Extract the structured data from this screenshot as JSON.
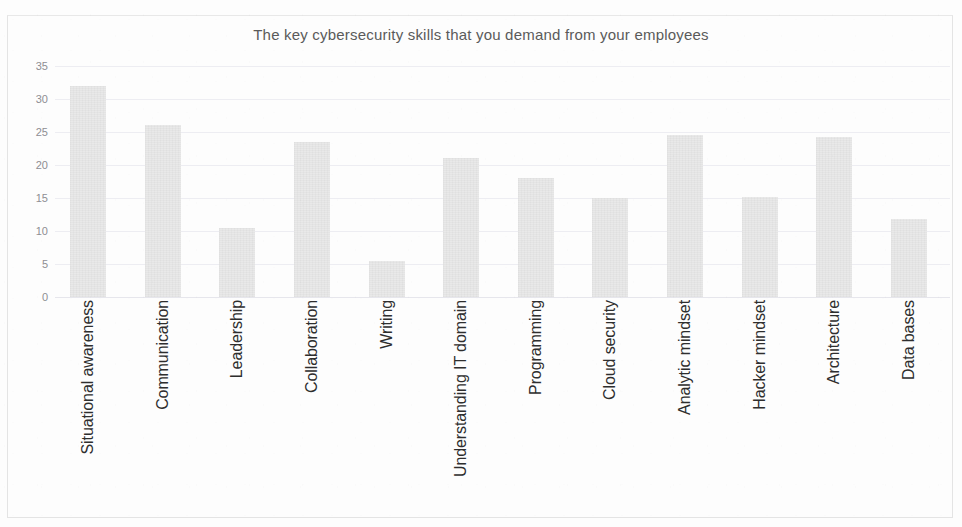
{
  "chart_data": {
    "type": "bar",
    "title": "The key cybersecurity skills that you demand from your employees",
    "xlabel": "",
    "ylabel": "",
    "ylim": [
      0,
      35
    ],
    "yticks": [
      0,
      5,
      10,
      15,
      20,
      25,
      30,
      35
    ],
    "ytick_labels": [
      "0",
      "5",
      "10",
      "15",
      "20",
      "25",
      "30",
      "35"
    ],
    "grid": true,
    "legend": false,
    "bar_color": "#e9e9e9",
    "categories": [
      "Situational awareness",
      "Communication",
      "Leadership",
      "Collaboration",
      "Writing",
      "Understanding IT domain",
      "Programming",
      "Cloud security",
      "Analytic mindset",
      "Hacker mindset",
      "Architecture",
      "Data bases"
    ],
    "values": [
      32,
      26,
      10.5,
      23.5,
      5.5,
      21,
      18,
      15,
      24.5,
      15.2,
      24.3,
      11.8
    ]
  }
}
